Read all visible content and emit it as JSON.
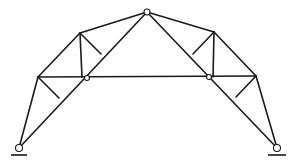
{
  "diagram": {
    "type": "three-hinged arch truss",
    "colors": {
      "line": "#1a1a1a",
      "background": "#ffffff"
    },
    "nodes": {
      "A": [
        19,
        148
      ],
      "B": [
        277,
        148
      ],
      "L1": [
        38,
        77
      ],
      "L2": [
        80,
        33
      ],
      "LB": [
        82,
        77
      ],
      "C": [
        147,
        12
      ],
      "R2": [
        214,
        32
      ],
      "RB": [
        213,
        77
      ],
      "R1": [
        256,
        76
      ],
      "LS1": [
        59,
        98
      ],
      "LS2": [
        101,
        54
      ],
      "RS2": [
        193,
        54
      ],
      "RS1": [
        236,
        97
      ]
    },
    "members": [
      [
        "A",
        "L1"
      ],
      [
        "L1",
        "L2"
      ],
      [
        "L2",
        "C"
      ],
      [
        "C",
        "R2"
      ],
      [
        "R2",
        "R1"
      ],
      [
        "R1",
        "B"
      ],
      [
        "A",
        "C"
      ],
      [
        "C",
        "B"
      ],
      [
        "L1",
        "R1"
      ],
      [
        "L2",
        "LB"
      ],
      [
        "R2",
        "RB"
      ],
      [
        "L1",
        "LS1"
      ],
      [
        "L2",
        "LS2"
      ],
      [
        "R2",
        "RS2"
      ],
      [
        "R1",
        "RS1"
      ]
    ],
    "hinges": [
      {
        "name": "crown-hinge",
        "at": [
          147,
          12
        ],
        "r": 3
      },
      {
        "name": "left-chord-hinge",
        "at": [
          87,
          78
        ],
        "r": 2.5
      },
      {
        "name": "right-chord-hinge",
        "at": [
          209,
          77
        ],
        "r": 2.5
      },
      {
        "name": "left-support-pin",
        "at": [
          19,
          148
        ],
        "r": 3.5
      },
      {
        "name": "right-support-pin",
        "at": [
          277,
          148
        ],
        "r": 3.5
      }
    ],
    "grounds": [
      {
        "name": "left-ground-line",
        "x1": 11,
        "x2": 27,
        "y": 155
      },
      {
        "name": "right-ground-line",
        "x1": 268,
        "x2": 286,
        "y": 155
      }
    ]
  }
}
